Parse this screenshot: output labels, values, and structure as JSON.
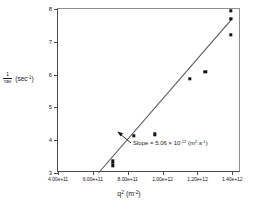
{
  "chart_data": {
    "type": "scatter",
    "title": "",
    "xlabel": "q² (m⁻²)",
    "ylabel": "1/τav (sec⁻¹)",
    "ylabel_parts": {
      "numerator": "1",
      "denominator": "τav",
      "units": "(sec⁻¹)"
    },
    "xlabel_parts": {
      "symbol": "q",
      "exponent": "2",
      "units_open": "(m",
      "units_exp": "-2",
      "units_close": ")"
    },
    "xlim": [
      400000000000.0,
      1450000000000.0
    ],
    "ylim": [
      3.0,
      8.0
    ],
    "grid": false,
    "legend": null,
    "xticks": [
      400000000000.0,
      600000000000.0,
      800000000000.0,
      1000000000000.0,
      1200000000000.0,
      1400000000000.0
    ],
    "xticklabels": [
      "4.00e+11",
      "6.00e+11",
      "8.00e+11",
      "1.00e+12",
      "1.20e+12",
      "1.40e+12"
    ],
    "yticks": [
      3,
      4,
      5,
      6,
      7,
      8
    ],
    "yticklabels": [
      "3",
      "4",
      "5",
      "6",
      "7",
      "8"
    ],
    "marker": "square",
    "marker_color": "#111111",
    "line_color": "#555555",
    "points": [
      {
        "x": 715000000000.0,
        "y": 3.36
      },
      {
        "x": 715000000000.0,
        "y": 3.24
      },
      {
        "x": 835000000000.0,
        "y": 4.13
      },
      {
        "x": 955000000000.0,
        "y": 4.18
      },
      {
        "x": 1155000000000.0,
        "y": 5.88
      },
      {
        "x": 1245000000000.0,
        "y": 6.09
      },
      {
        "x": 1392000000000.0,
        "y": 7.95
      },
      {
        "x": 1392000000000.0,
        "y": 7.7
      },
      {
        "x": 1392000000000.0,
        "y": 7.21
      }
    ],
    "fit_line": {
      "x_start": 632000000000.0,
      "y_start": 3.0,
      "x_end": 1402000000000.0,
      "y_end": 7.72,
      "slope_value": "5.06",
      "slope_exponent": "-12",
      "slope_units": "(m².s⁻¹)"
    },
    "annotation": {
      "prefix": "Slope",
      "equals": "=",
      "mantissa": "5.06",
      "times": "×",
      "base": "10",
      "exponent": "-12",
      "unit_open": "(m",
      "unit_sup1": "2",
      "unit_mid": ".s",
      "unit_sup2": "-1",
      "unit_close": ")",
      "full_text": "Slope = 5.06 × 10⁻¹² (m².s⁻¹)"
    }
  }
}
